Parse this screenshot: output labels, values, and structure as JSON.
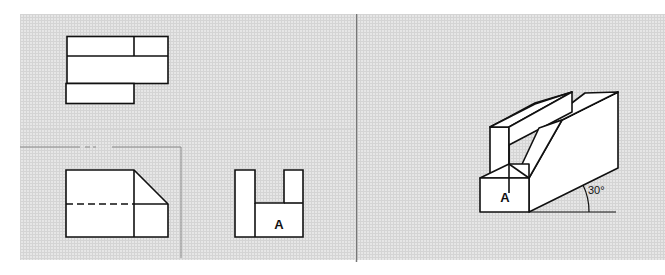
{
  "diagram": {
    "type": "orthographic-projection-exercise",
    "views": {
      "top_view": {
        "label": ""
      },
      "front_view": {
        "label": "",
        "hidden_line": "dashed"
      },
      "side_view": {
        "face_label": "A"
      }
    },
    "isometric": {
      "face_label": "A",
      "angle_label": "30°"
    }
  },
  "colors": {
    "background": "#e6e6e6",
    "grid": "#d4d4d4",
    "line": "#111111",
    "face": "#ffffff"
  }
}
